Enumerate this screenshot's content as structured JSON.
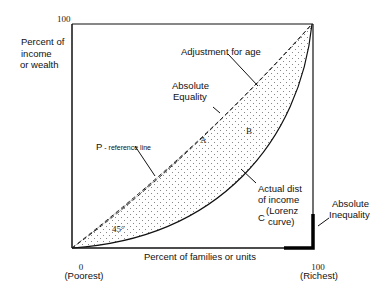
{
  "diagram": {
    "type": "lorenz_curve",
    "axes": {
      "y_top_tick": "100",
      "y_label_lines": [
        "Percent of",
        "income",
        "or wealth"
      ],
      "x_origin_tick": "0",
      "x_origin_sub": "(Poorest)",
      "x_end_tick": "100",
      "x_end_sub": "(Richest)",
      "x_label": "Percent of families or units"
    },
    "labels": {
      "adjustment": "Adjustment for age",
      "abs_equality_lines": [
        "Absolute",
        "Equality"
      ],
      "p_ref_main": "P",
      "p_ref_rest": " - reference line",
      "region_a": "A",
      "region_b": "B",
      "region_c": "C",
      "lorenz_lines": [
        "Actual dist",
        "of income",
        "(Lorenz",
        "curve)"
      ],
      "angle": "45°",
      "abs_inequality_lines": [
        "Absolute",
        "Inequality"
      ]
    },
    "colors": {
      "line": "#111111",
      "band_fill": "#b8b8b8",
      "dot_fill": "#9a9a9a",
      "background": "#ffffff"
    }
  }
}
